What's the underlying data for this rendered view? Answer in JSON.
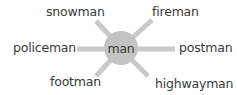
{
  "diagram": {
    "type": "word-spider",
    "colors": {
      "spoke": "#c9c9c9",
      "hub": "#c3c3c3",
      "text": "#3a3a3a",
      "background": "#ffffff"
    },
    "center": {
      "label": "man"
    },
    "spokes": [
      {
        "label": "snowman",
        "direction": "upper-left"
      },
      {
        "label": "fireman",
        "direction": "upper-right"
      },
      {
        "label": "policeman",
        "direction": "left"
      },
      {
        "label": "postman",
        "direction": "right"
      },
      {
        "label": "footman",
        "direction": "lower-left"
      },
      {
        "label": "highwayman",
        "direction": "lower-right"
      }
    ]
  }
}
